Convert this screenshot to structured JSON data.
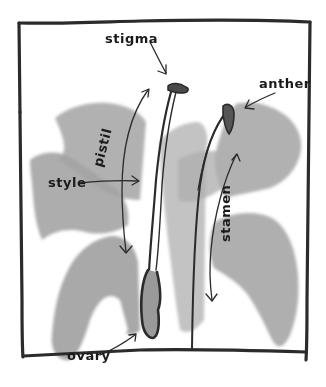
{
  "diagram": {
    "colors": {
      "ink": "#2b2b2b",
      "petal": "#a9a9a9",
      "petal_light": "#c9c9c9",
      "background": "#ffffff"
    },
    "labels": {
      "stigma": "stigma",
      "anther": "anther",
      "pistil": "pistil",
      "style": "style",
      "stamen": "stamen",
      "ovary": "ovary"
    }
  }
}
